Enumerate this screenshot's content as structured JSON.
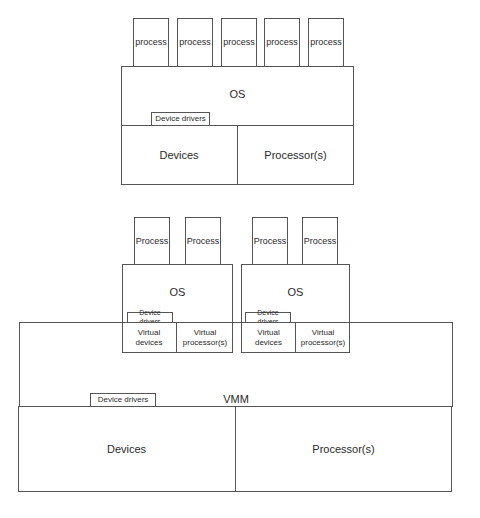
{
  "top_diagram": {
    "processes": [
      "process",
      "process",
      "process",
      "process",
      "process"
    ],
    "os_label": "OS",
    "device_drivers_label": "Device drivers",
    "devices_label": "Devices",
    "processors_label": "Processor(s)"
  },
  "bottom_diagram": {
    "vms": [
      {
        "processes": [
          "Process",
          "Process"
        ],
        "os_label": "OS",
        "device_drivers_label": "Device drivers",
        "virtual_devices_label": "Virtual devices",
        "virtual_processors_label": "Virtual processor(s)"
      },
      {
        "processes": [
          "Process",
          "Process"
        ],
        "os_label": "OS",
        "device_drivers_label": "Device drivers",
        "virtual_devices_label": "Virtual devices",
        "virtual_processors_label": "Virtual processor(s)"
      }
    ],
    "vmm_label": "VMM",
    "vmm_device_drivers_label": "Device drivers",
    "devices_label": "Devices",
    "processors_label": "Processor(s)"
  },
  "colors": {
    "line": "#555555",
    "text": "#2a2a2a",
    "background": "#ffffff"
  }
}
